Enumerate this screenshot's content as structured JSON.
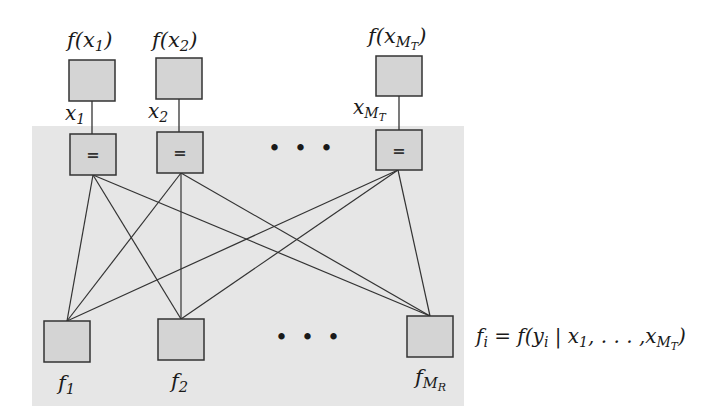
{
  "diagram": {
    "type": "factor-graph",
    "colors": {
      "shaded_region": "#e6e6e6",
      "node_fill": "#d4d4d4",
      "node_stroke": "#333333",
      "edge": "#333333",
      "text": "#1a1a1a"
    },
    "prior_factors": [
      {
        "label": "f(x",
        "sub": "1",
        "tail": ")"
      },
      {
        "label": "f(x",
        "sub": "2",
        "tail": ")"
      },
      {
        "label": "f(x",
        "sub": "M",
        "subsub": "T",
        "tail": ")"
      }
    ],
    "variables": [
      {
        "label": "x",
        "sub": "1"
      },
      {
        "label": "x",
        "sub": "2"
      },
      {
        "label": "x",
        "sub": "M",
        "subsub": "T"
      }
    ],
    "equality_symbol": "=",
    "ellipsis": "• • •",
    "observation_factors": [
      {
        "label": "f",
        "sub": "1"
      },
      {
        "label": "f",
        "sub": "2"
      },
      {
        "label": "f",
        "sub": "M",
        "subsub": "R"
      }
    ],
    "equation": {
      "lhs": "f",
      "lhs_sub": "i",
      "rhs_pre": " = f(y",
      "rhs_sub": "i",
      "rhs_mid": " | x",
      "rhs_sub2": "1",
      "rhs_dots": ", . . . ,x",
      "rhs_sub3": "M",
      "rhs_subsub3": "T",
      "rhs_tail": ")"
    }
  }
}
